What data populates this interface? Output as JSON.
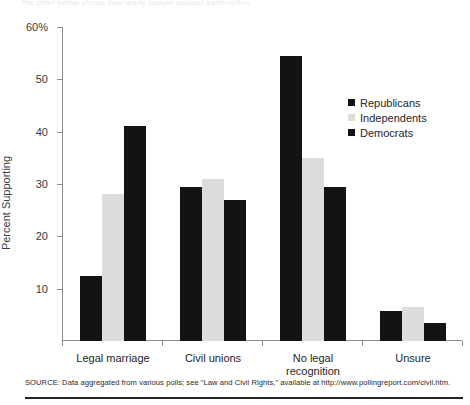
{
  "top_caption": "the chart below shows how many people support each option",
  "axis": {
    "ylabel": "Percent Supporting",
    "yticks": [
      "60%",
      "50",
      "40",
      "30",
      "20",
      "10"
    ],
    "ytick_values": [
      60,
      50,
      40,
      30,
      20,
      10
    ]
  },
  "legend": {
    "position": "inside-top-right",
    "items": [
      {
        "label": "Republicans",
        "color": "#131313"
      },
      {
        "label": "Independents",
        "color": "#dcdcdc"
      },
      {
        "label": "Democrats",
        "color": "#131313"
      }
    ]
  },
  "source": {
    "text": "SOURCE: Data aggregated from various polls; see “Law and Civil Rights,” available at http://www.pollingreport.com/civil.htm."
  },
  "chart_data": {
    "type": "bar",
    "title": "",
    "subtitle": "",
    "xlabel": "",
    "ylabel": "Percent Supporting",
    "ylim": [
      0,
      60
    ],
    "grid": false,
    "legend_position": "inside-top-right",
    "categories": [
      "Legal marriage",
      "Civil unions",
      "No legal\nrecognition",
      "Unsure"
    ],
    "series": [
      {
        "name": "Republicans",
        "color": "#131313",
        "values": [
          12.5,
          29.5,
          54.5,
          5.8
        ]
      },
      {
        "name": "Independents",
        "color": "#dcdcdc",
        "values": [
          28.0,
          31.0,
          35.0,
          6.5
        ]
      },
      {
        "name": "Democrats",
        "color": "#131313",
        "values": [
          41.0,
          27.0,
          29.5,
          3.5
        ]
      }
    ]
  }
}
